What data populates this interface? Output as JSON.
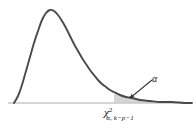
{
  "figure": {
    "background_color": "#ffffff",
    "curve_color": "#4a4a4a",
    "shade_color": "#d5d5d5",
    "axis_color": "#c8c8c8",
    "arrow_color": "#3a3a3a",
    "text_color": "#1a1a1a"
  },
  "labels": {
    "alpha": "α",
    "critical_value": {
      "symbol": "χ",
      "superscript": "2",
      "subscript": "α, k−p−1",
      "full_text": "χ² α, k−p−1"
    }
  },
  "chart_data": {
    "type": "line",
    "xlabel": "",
    "ylabel": "",
    "grid": false,
    "legend": null,
    "annotations": [
      {
        "name": "alpha-region-label",
        "text": "α",
        "x_px": 155,
        "y_px": 80,
        "arrow_to_x_px": 130,
        "arrow_to_y_px": 98
      },
      {
        "name": "critical-value-tick-label",
        "text": "χ²α, k−p−1",
        "x_px": 118,
        "y_px": 112
      }
    ],
    "axis_baseline": {
      "x_start_px": 8,
      "x_end_px": 192,
      "y_px": 103
    },
    "critical_value_x_px": 114,
    "shaded_region": {
      "from_x_px": 114,
      "to_x_px": 192,
      "fill": "#d5d5d5"
    },
    "curve_points_px": [
      [
        14,
        103
      ],
      [
        18,
        96
      ],
      [
        22,
        85
      ],
      [
        26,
        71
      ],
      [
        30,
        57
      ],
      [
        34,
        43
      ],
      [
        38,
        31
      ],
      [
        42,
        20
      ],
      [
        46,
        13
      ],
      [
        50,
        10
      ],
      [
        54,
        11
      ],
      [
        58,
        15
      ],
      [
        62,
        21
      ],
      [
        66,
        28
      ],
      [
        70,
        36
      ],
      [
        74,
        44
      ],
      [
        78,
        51
      ],
      [
        82,
        58
      ],
      [
        86,
        64
      ],
      [
        90,
        70
      ],
      [
        94,
        75
      ],
      [
        98,
        80
      ],
      [
        102,
        84
      ],
      [
        106,
        87
      ],
      [
        110,
        90
      ],
      [
        114,
        92
      ],
      [
        120,
        95
      ],
      [
        126,
        97
      ],
      [
        132,
        98
      ],
      [
        140,
        100
      ],
      [
        150,
        101
      ],
      [
        160,
        102
      ],
      [
        172,
        102
      ],
      [
        184,
        103
      ],
      [
        192,
        103
      ]
    ]
  }
}
